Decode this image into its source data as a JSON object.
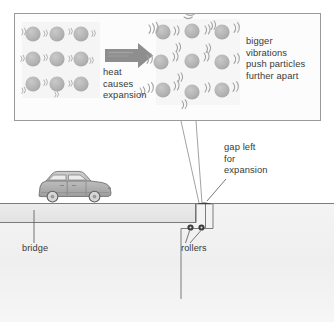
{
  "diagram": {
    "callout_box": {
      "name": "particle-expansion-callout",
      "border_color": "#9a9a9a",
      "fill_color": "#fcfcfc"
    },
    "cool_lattice": {
      "label": "cool compact particle arrangement",
      "rows": 3,
      "cols": 3,
      "particle_count": 9,
      "particle_color": "#b5b5b5",
      "spacing_px": 23,
      "vibration_size": "small"
    },
    "hot_lattice": {
      "label": "heated expanded particle arrangement",
      "rows": 3,
      "cols": 3,
      "particle_count": 9,
      "particle_color": "#b5b5b5",
      "spacing_px": 30,
      "vibration_size": "large"
    },
    "arrow": {
      "name": "heat-arrow",
      "color": "#8e8e8e",
      "direction": "right"
    },
    "labels": {
      "heat_causes_expansion": [
        "heat",
        "causes",
        "expansion"
      ],
      "bigger_vibrations": [
        "bigger",
        "vibrations",
        "push particles",
        "further apart"
      ],
      "gap_left_for_expansion": [
        "gap left",
        "for",
        "expansion"
      ],
      "bridge": "bridge",
      "rollers": "rollers"
    },
    "scene": {
      "car": {
        "name": "car",
        "body_color": "#b9b9b9",
        "window_color": "#e8e8e8",
        "wheel_color": "#7d7d7d",
        "facing": "right"
      },
      "ground_color": "#f1f1f1",
      "deck_color": "#e9e9e9",
      "line_color": "#6e6e6e",
      "roller_color": "#3c3c3c",
      "roller_count": 2,
      "expansion_gap": {
        "name": "expansion-gap",
        "color": "#3d3d3d"
      }
    }
  }
}
